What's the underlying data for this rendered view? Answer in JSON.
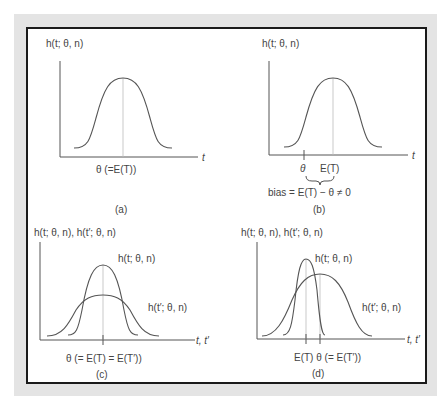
{
  "figure": {
    "panels": [
      {
        "id": "a",
        "caption": "(a)",
        "y_label": "h(t; θ, n)",
        "x_label": "t",
        "below_axis": "θ (=E(T))",
        "curves": [
          {
            "name": "h(t; θ, n)",
            "center_x": 123,
            "peak_y": 78
          }
        ]
      },
      {
        "id": "b",
        "caption": "(b)",
        "y_label": "h(t; θ, n)",
        "x_label": "t",
        "tick_theta": "θ",
        "tick_ET": "E(T)",
        "bias": "bias = E(T) − θ ≠ 0",
        "curves": [
          {
            "name": "h(t; θ, n)",
            "center_x": 333,
            "peak_y": 78
          }
        ]
      },
      {
        "id": "c",
        "caption": "(c)",
        "y_label": "h(t; θ, n), h(t′; θ, n)",
        "x_label": "t, t′",
        "below_axis": "θ (= E(T) = E(T′))",
        "curve_labels": [
          "h(t; θ, n)",
          "h(t′; θ, n)"
        ]
      },
      {
        "id": "d",
        "caption": "(d)",
        "y_label": "h(t; θ, n), h(t′; θ, n)",
        "x_label": "t, t′",
        "below_axis": "E(T) θ (= E(T′))",
        "curve_labels": [
          "h(t; θ, n)",
          "h(t′; θ, n)"
        ]
      }
    ],
    "colors": {
      "line": "#555555",
      "text": "#444444",
      "frame": "#1a1a1a",
      "background_panel": "#e4e4e4",
      "dotted": "#aaaaaa"
    }
  }
}
